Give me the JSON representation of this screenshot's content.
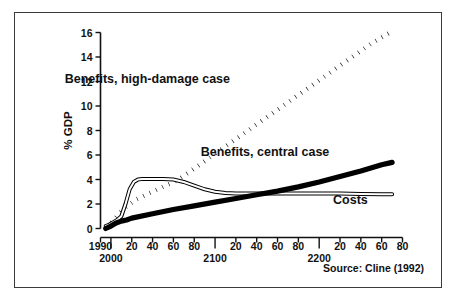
{
  "figure": {
    "border_color": "#3a3a3a",
    "background": "#ffffff",
    "source_note": "Source: Cline (1992)"
  },
  "chart_data": {
    "type": "line",
    "title": "",
    "xlabel": "",
    "ylabel": "% GDP",
    "xlim": [
      1990,
      2280
    ],
    "ylim": [
      0,
      16
    ],
    "grid": false,
    "legend_position": "inline-annotations",
    "y_ticks": [
      0,
      2,
      4,
      6,
      8,
      10,
      12,
      14,
      16
    ],
    "y_tick_labels": [
      "0",
      "2",
      "4",
      "6",
      "8",
      "10",
      "12",
      "14",
      "16"
    ],
    "x_ticks": [
      1990,
      2000,
      2020,
      2040,
      2060,
      2080,
      2100,
      2120,
      2140,
      2160,
      2180,
      2200,
      2220,
      2240,
      2260,
      2280
    ],
    "x_tick_labels": [
      "1990",
      "2000",
      "20",
      "40",
      "60",
      "80",
      "2100",
      "20",
      "40",
      "60",
      "80",
      "2200",
      "20",
      "40",
      "60",
      "80"
    ],
    "x_major_labels": [
      "2000",
      "2100",
      "2200"
    ],
    "series": [
      {
        "name": "Benefits, high-damage case",
        "style": "dotted",
        "color": "#000000",
        "x": [
          1995,
          2000,
          2005,
          2010,
          2015,
          2020,
          2025,
          2030,
          2035,
          2040,
          2045,
          2050,
          2055,
          2060,
          2065,
          2070,
          2080,
          2090,
          2100,
          2110,
          2120,
          2130,
          2140,
          2150,
          2160,
          2170,
          2180,
          2190,
          2200,
          2210,
          2220,
          2230,
          2240,
          2250,
          2260,
          2270
        ],
        "y": [
          0.15,
          0.45,
          0.9,
          1.4,
          1.8,
          2.1,
          2.4,
          2.6,
          2.8,
          3.0,
          3.2,
          3.4,
          3.6,
          3.8,
          4.0,
          4.3,
          4.9,
          5.5,
          6.1,
          6.7,
          7.3,
          7.9,
          8.5,
          9.1,
          9.7,
          10.3,
          10.9,
          11.5,
          12.1,
          12.7,
          13.3,
          13.9,
          14.5,
          15.1,
          15.6,
          16.1
        ]
      },
      {
        "name": "Benefits, central case",
        "style": "thin-outline",
        "color": "#000000",
        "x": [
          1995,
          1998,
          2002,
          2006,
          2010,
          2014,
          2018,
          2022,
          2026,
          2030,
          2040,
          2050,
          2060,
          2070,
          2080,
          2090,
          2100,
          2110,
          2120,
          2140,
          2160,
          2180,
          2200,
          2220,
          2240,
          2260,
          2270
        ],
        "y": [
          0.2,
          0.3,
          0.5,
          0.7,
          1.0,
          2.0,
          3.2,
          3.8,
          4.0,
          4.05,
          4.05,
          4.05,
          4.0,
          3.8,
          3.5,
          3.2,
          3.0,
          2.9,
          2.85,
          2.85,
          2.85,
          2.85,
          2.85,
          2.85,
          2.82,
          2.8,
          2.8
        ]
      },
      {
        "name": "Costs",
        "style": "thick-solid",
        "color": "#000000",
        "x": [
          1995,
          2000,
          2005,
          2010,
          2015,
          2020,
          2040,
          2060,
          2080,
          2100,
          2120,
          2140,
          2160,
          2180,
          2200,
          2220,
          2240,
          2260,
          2270
        ],
        "y": [
          0.0,
          0.2,
          0.45,
          0.6,
          0.7,
          0.85,
          1.2,
          1.55,
          1.85,
          2.15,
          2.45,
          2.75,
          3.05,
          3.4,
          3.8,
          4.25,
          4.7,
          5.2,
          5.4
        ]
      }
    ],
    "annotations": [
      {
        "text": "Benefits, high-damage case",
        "x": 2035,
        "y": 11.9
      },
      {
        "text": "Benefits, central case",
        "x": 2148,
        "y": 5.9
      },
      {
        "text": "Costs",
        "x": 2230,
        "y": 2.0
      }
    ]
  }
}
